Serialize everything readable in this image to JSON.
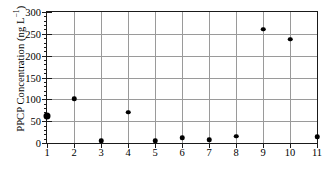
{
  "chart_data": {
    "type": "scatter",
    "title": "",
    "xlabel": "",
    "ylabel": "PPCP Concentration (ng L⁻¹)",
    "ylabel_main": "PPCP Concentration (ng L",
    "ylabel_sup": "−1",
    "ylabel_tail": ")",
    "x": [
      1,
      2,
      3,
      4,
      5,
      6,
      7,
      8,
      9,
      10,
      11
    ],
    "values": [
      63,
      101,
      5,
      71,
      5,
      12,
      8,
      16,
      261,
      238,
      14
    ],
    "xlim": [
      1,
      11
    ],
    "ylim": [
      0,
      300
    ],
    "ytick_labels": [
      "300",
      "250",
      "200",
      "150",
      "100",
      "50",
      "0"
    ],
    "ytick_values": [
      300,
      250,
      200,
      150,
      100,
      50,
      0
    ],
    "yminor_step": 10,
    "xtick_labels": [
      "1",
      "2",
      "3",
      "4",
      "5",
      "6",
      "7",
      "8",
      "9",
      "10",
      "11"
    ],
    "grid": "both",
    "legend": "none",
    "marker_color": "#000000",
    "grid_color": "#9a9a9a",
    "axis_color": "#1a1a1a",
    "marker_sizes": [
      7,
      4.5,
      4.5,
      4.5,
      4.5,
      4.5,
      4.5,
      4.5,
      4.5,
      4.5,
      4.5
    ]
  },
  "caption_fragment": ""
}
